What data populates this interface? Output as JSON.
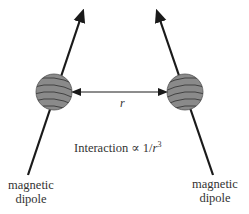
{
  "diagram": {
    "left_dipole": {
      "label_line1": "magnetic",
      "label_line2": "dipole"
    },
    "right_dipole": {
      "label_line1": "magnetic",
      "label_line2": "dipole"
    },
    "separation_label": "r",
    "interaction": {
      "prefix": "Interaction ∝ 1/",
      "variable": "r",
      "exponent": "3"
    },
    "colors": {
      "sphere_fill": "#8a8a8a",
      "sphere_stripe": "#3a3a3a",
      "arrow": "#1a1a1a",
      "text": "#333333"
    }
  }
}
